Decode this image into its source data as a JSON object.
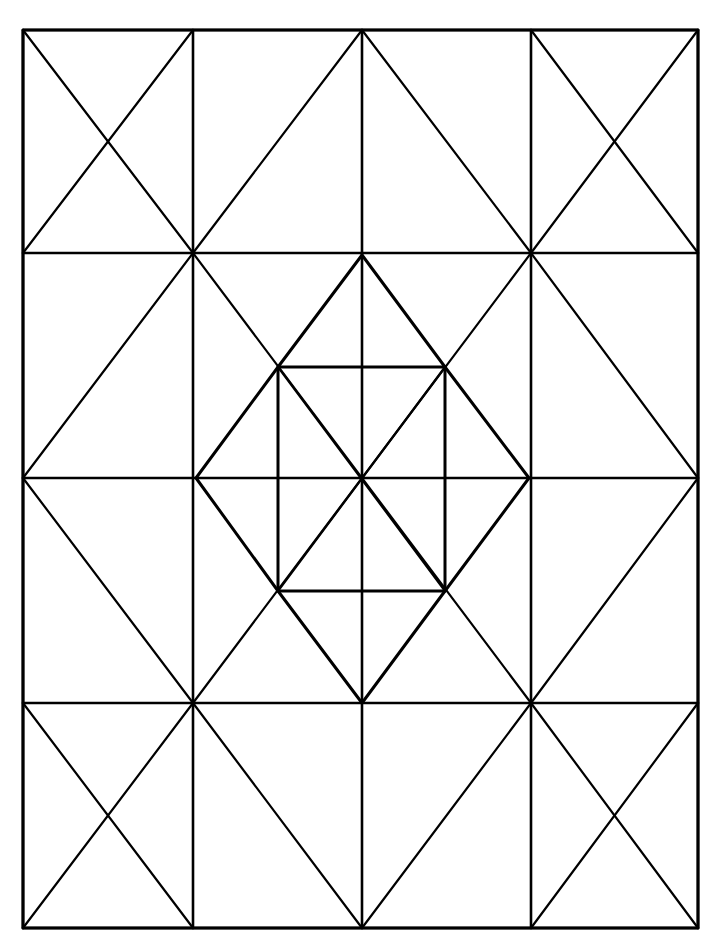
{
  "title": "Geometric quilt pattern line drawing",
  "style": {
    "background": "#ffffff",
    "stroke": "#000000",
    "frame_width": 3,
    "grid_width": 2.6,
    "diagonal_width": 2.2
  },
  "frame": {
    "x1": 23,
    "y1": 30,
    "x2": 698,
    "y2": 928
  },
  "grid": {
    "columns_x": [
      23,
      193,
      362,
      531,
      698
    ],
    "rows_y": [
      30,
      253,
      478,
      703,
      928
    ]
  },
  "blocks": [
    {
      "name": "block-top-left",
      "row": 0,
      "col": 0,
      "diagonals": "x"
    },
    {
      "name": "block-top-inner-left",
      "row": 0,
      "col": 1,
      "diagonals": "bl-tr"
    },
    {
      "name": "block-top-inner-right",
      "row": 0,
      "col": 2,
      "diagonals": "tl-br"
    },
    {
      "name": "block-top-right",
      "row": 0,
      "col": 3,
      "diagonals": "x"
    },
    {
      "name": "block-upper-left",
      "row": 1,
      "col": 0,
      "diagonals": "bl-tr"
    },
    {
      "name": "block-upper-right",
      "row": 1,
      "col": 3,
      "diagonals": "tl-br"
    },
    {
      "name": "block-lower-left",
      "row": 2,
      "col": 0,
      "diagonals": "tl-br"
    },
    {
      "name": "block-lower-right",
      "row": 2,
      "col": 3,
      "diagonals": "bl-tr"
    },
    {
      "name": "block-bottom-left",
      "row": 3,
      "col": 0,
      "diagonals": "x"
    },
    {
      "name": "block-bottom-inner-left",
      "row": 3,
      "col": 1,
      "diagonals": "tl-br"
    },
    {
      "name": "block-bottom-inner-right",
      "row": 3,
      "col": 2,
      "diagonals": "bl-tr"
    },
    {
      "name": "block-bottom-right",
      "row": 3,
      "col": 3,
      "diagonals": "x"
    }
  ],
  "center": {
    "outer_x_lines": [
      {
        "x1": 193,
        "y1": 253,
        "x2": 531,
        "y2": 703
      },
      {
        "x1": 531,
        "y1": 253,
        "x2": 193,
        "y2": 703
      }
    ],
    "hexagon_points": "362,255 445,367 529,478 445,591 362,703 278,591 196,478 278,367",
    "inner_square": {
      "x": 278,
      "y": 367,
      "width": 167,
      "height": 224
    },
    "center_point": {
      "x": 362,
      "y": 478
    }
  }
}
